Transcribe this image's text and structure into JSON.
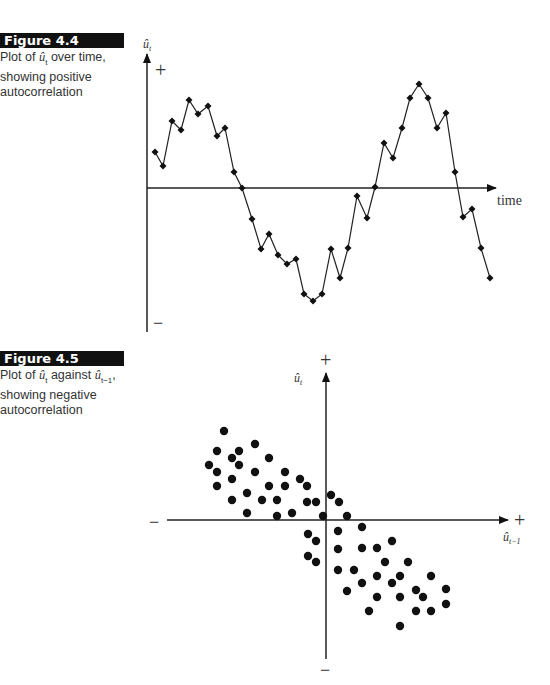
{
  "figures": [
    {
      "label": "Figure 4.4",
      "caption_pre": "Plot of ",
      "caption_sym": "û",
      "caption_sub": "t",
      "caption_post": " over time, showing positive autocorrelation"
    },
    {
      "label": "Figure 4.5",
      "caption_pre": "Plot of ",
      "caption_sym": "û",
      "caption_sub": "t",
      "caption_mid": " against ",
      "caption_sym2": "û",
      "caption_sub2": "t−1",
      "caption_post": ", showing negative autocorrelation"
    }
  ],
  "chart_data": [
    {
      "type": "line",
      "title": "Figure 4.4",
      "xlabel": "time",
      "ylabel": "û_t",
      "y_top_marker": "+",
      "y_bottom_marker": "−",
      "grid": false,
      "markers": "diamond",
      "pixel_points": [
        [
          155,
          152
        ],
        [
          163,
          166
        ],
        [
          172,
          121
        ],
        [
          181,
          130
        ],
        [
          189,
          100
        ],
        [
          198,
          114
        ],
        [
          208,
          106
        ],
        [
          217,
          136
        ],
        [
          225,
          128
        ],
        [
          234,
          172
        ],
        [
          242,
          188
        ],
        [
          252,
          219
        ],
        [
          261,
          249
        ],
        [
          269,
          234
        ],
        [
          278,
          255
        ],
        [
          287,
          264
        ],
        [
          296,
          259
        ],
        [
          304,
          294
        ],
        [
          313,
          301
        ],
        [
          322,
          294
        ],
        [
          331,
          249
        ],
        [
          340,
          278
        ],
        [
          348,
          248
        ],
        [
          357,
          196
        ],
        [
          367,
          218
        ],
        [
          375,
          187
        ],
        [
          384,
          143
        ],
        [
          393,
          158
        ],
        [
          402,
          128
        ],
        [
          410,
          98
        ],
        [
          419,
          84
        ],
        [
          428,
          98
        ],
        [
          437,
          128
        ],
        [
          446,
          113
        ],
        [
          455,
          172
        ],
        [
          463,
          217
        ],
        [
          472,
          209
        ],
        [
          481,
          248
        ],
        [
          490,
          278
        ]
      ],
      "axis_origin_y": 188
    },
    {
      "type": "scatter",
      "title": "Figure 4.5",
      "xlabel": "û_{t−1}",
      "ylabel": "û_t",
      "x_markers": [
        "−",
        "+"
      ],
      "y_markers": [
        "+",
        "−"
      ],
      "grid": false,
      "pixel_points": [
        [
          224,
          431
        ],
        [
          217,
          451
        ],
        [
          239,
          451
        ],
        [
          255,
          444
        ],
        [
          232,
          458
        ],
        [
          209,
          465
        ],
        [
          239,
          465
        ],
        [
          269,
          458
        ],
        [
          217,
          472
        ],
        [
          255,
          472
        ],
        [
          285,
          472
        ],
        [
          232,
          479
        ],
        [
          300,
          479
        ],
        [
          217,
          486
        ],
        [
          269,
          486
        ],
        [
          285,
          486
        ],
        [
          307,
          486
        ],
        [
          247,
          493
        ],
        [
          232,
          500
        ],
        [
          262,
          500
        ],
        [
          277,
          500
        ],
        [
          307,
          502
        ],
        [
          316,
          502
        ],
        [
          247,
          513
        ],
        [
          277,
          516
        ],
        [
          292,
          513
        ],
        [
          323,
          516
        ],
        [
          331,
          495
        ],
        [
          339,
          502
        ],
        [
          347,
          516
        ],
        [
          338,
          531
        ],
        [
          362,
          527
        ],
        [
          308,
          534
        ],
        [
          316,
          541
        ],
        [
          392,
          541
        ],
        [
          338,
          549
        ],
        [
          362,
          548
        ],
        [
          377,
          548
        ],
        [
          308,
          556
        ],
        [
          316,
          562
        ],
        [
          385,
          562
        ],
        [
          408,
          562
        ],
        [
          338,
          570
        ],
        [
          354,
          570
        ],
        [
          377,
          576
        ],
        [
          400,
          576
        ],
        [
          431,
          576
        ],
        [
          362,
          583
        ],
        [
          392,
          583
        ],
        [
          347,
          591
        ],
        [
          416,
          590
        ],
        [
          423,
          597
        ],
        [
          446,
          589
        ],
        [
          377,
          597
        ],
        [
          400,
          597
        ],
        [
          369,
          611
        ],
        [
          416,
          611
        ],
        [
          431,
          611
        ],
        [
          446,
          604
        ],
        [
          400,
          626
        ]
      ],
      "axis_origin": [
        326,
        520
      ]
    }
  ]
}
